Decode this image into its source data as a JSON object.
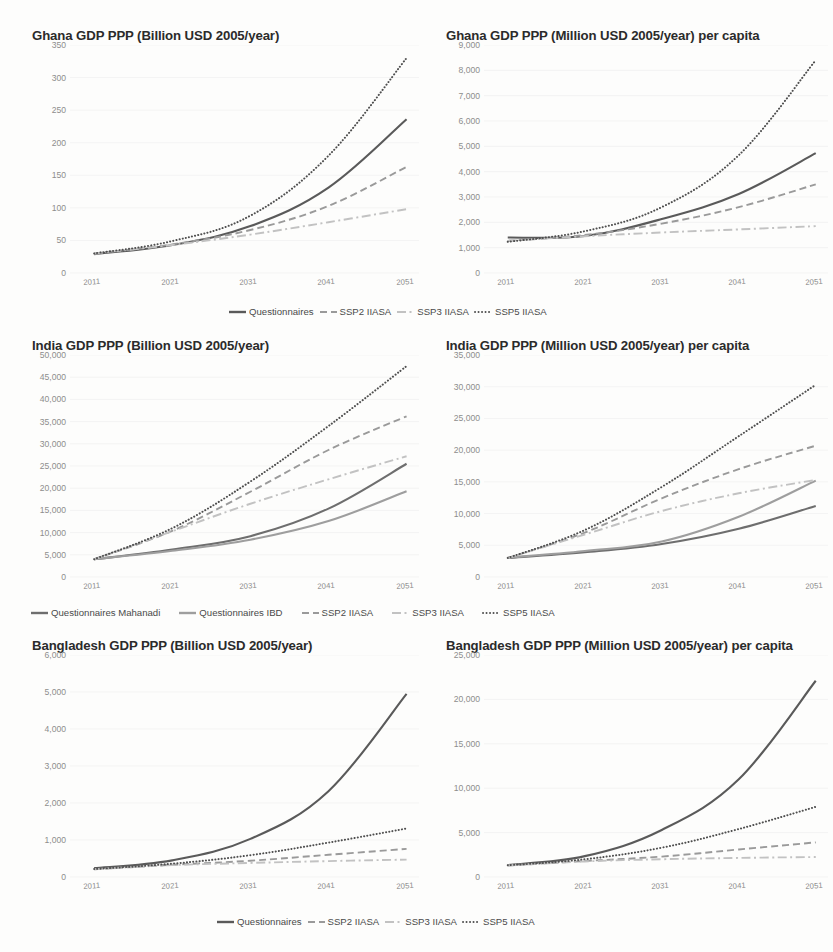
{
  "page": {
    "background": "#fdfdfc",
    "colors": {
      "solid_dark": "#5a5a5a",
      "solid_mid": "#8a8a8a",
      "dashed": "#9a9a9a",
      "dashdot": "#c2c2c2",
      "dotted": "#4f4f4f",
      "axis_text": "#8d8d8d",
      "title_text": "#2b2b2b",
      "gridline": "#efefef"
    }
  },
  "charts": [
    {
      "id": "ghana-total",
      "chart_data": {
        "type": "line",
        "title": "Ghana GDP PPP (Billion USD 2005/year)",
        "xlabel": "",
        "ylabel": "",
        "x": [
          2011,
          2021,
          2031,
          2041,
          2051
        ],
        "xticks": [
          "2011",
          "2021",
          "2031",
          "2041",
          "2051"
        ],
        "yticks": [
          "0",
          "50",
          "100",
          "150",
          "200",
          "250",
          "300",
          "350"
        ],
        "ylim": [
          0,
          350
        ],
        "ytick_step": 50,
        "grid": true,
        "legend_position": "bottom",
        "series": [
          {
            "name": "Questionnaires",
            "style": "solid",
            "color": "#5a5a5a",
            "values": [
              29,
              43,
              72,
              131,
              236
            ]
          },
          {
            "name": "SSP2 IIASA",
            "style": "dashed",
            "color": "#9a9a9a",
            "values": [
              30,
              44,
              66,
              103,
              163
            ]
          },
          {
            "name": "SSP3 IIASA",
            "style": "dashdot",
            "color": "#c2c2c2",
            "values": [
              30,
              43,
              59,
              78,
              98
            ]
          },
          {
            "name": "SSP5 IIASA",
            "style": "dotted",
            "color": "#4f4f4f",
            "values": [
              30,
              49,
              88,
              180,
              330
            ]
          }
        ]
      }
    },
    {
      "id": "ghana-percapita",
      "chart_data": {
        "type": "line",
        "title": "Ghana GDP PPP (Million USD 2005/year) per capita",
        "xlabel": "",
        "ylabel": "",
        "x": [
          2011,
          2021,
          2031,
          2041,
          2051
        ],
        "xticks": [
          "2011",
          "2021",
          "2031",
          "2041",
          "2051"
        ],
        "yticks": [
          "0",
          "1,000",
          "2,000",
          "3,000",
          "4,000",
          "5,000",
          "6,000",
          "7,000",
          "8,000",
          "9,000"
        ],
        "ylim": [
          0,
          9000
        ],
        "ytick_step": 1000,
        "grid": true,
        "legend_position": "bottom",
        "series": [
          {
            "name": "Questionnaires",
            "style": "solid",
            "color": "#5a5a5a",
            "values": [
              1400,
              1460,
              2130,
              3120,
              4730
            ]
          },
          {
            "name": "SSP2 IIASA",
            "style": "dashed",
            "color": "#9a9a9a",
            "values": [
              1270,
              1500,
              1950,
              2600,
              3500
            ]
          },
          {
            "name": "SSP3 IIASA",
            "style": "dashdot",
            "color": "#c2c2c2",
            "values": [
              1270,
              1450,
              1600,
              1720,
              1850
            ]
          },
          {
            "name": "SSP5 IIASA",
            "style": "dotted",
            "color": "#4f4f4f",
            "values": [
              1230,
              1650,
              2600,
              4650,
              8400
            ]
          }
        ]
      }
    },
    {
      "id": "india-total",
      "chart_data": {
        "type": "line",
        "title": "India GDP PPP (Billion USD 2005/year)",
        "xlabel": "",
        "ylabel": "",
        "x": [
          2011,
          2021,
          2031,
          2041,
          2051
        ],
        "xticks": [
          "2011",
          "2021",
          "2031",
          "2041",
          "2051"
        ],
        "yticks": [
          "0",
          "5,000",
          "10,000",
          "15,000",
          "20,000",
          "25,000",
          "30,000",
          "35,000",
          "40,000",
          "45,000",
          "50,000"
        ],
        "ylim": [
          0,
          50000
        ],
        "ytick_step": 5000,
        "grid": true,
        "legend_position": "bottom",
        "series": [
          {
            "name": "Questionnaires Mahanadi",
            "style": "solid",
            "color": "#6e6e6e",
            "values": [
              4000,
              6200,
              9200,
              15400,
              25500
            ]
          },
          {
            "name": "Questionnaires IBD",
            "style": "solid",
            "color": "#9e9e9e",
            "values": [
              4000,
              5900,
              8400,
              12600,
              19300
            ]
          },
          {
            "name": "SSP2 IIASA",
            "style": "dashed",
            "color": "#9a9a9a",
            "values": [
              4000,
              10400,
              19200,
              28600,
              36200
            ]
          },
          {
            "name": "SSP3 IIASA",
            "style": "dashdot",
            "color": "#c2c2c2",
            "values": [
              4000,
              10300,
              16500,
              22000,
              27200
            ]
          },
          {
            "name": "SSP5 IIASA",
            "style": "dotted",
            "color": "#4f4f4f",
            "values": [
              4000,
              11000,
              21500,
              34000,
              47500
            ]
          }
        ]
      }
    },
    {
      "id": "india-percapita",
      "chart_data": {
        "type": "line",
        "title": "India GDP PPP (Million USD 2005/year) per capita",
        "xlabel": "",
        "ylabel": "",
        "x": [
          2011,
          2021,
          2031,
          2041,
          2051
        ],
        "xticks": [
          "2011",
          "2021",
          "2031",
          "2041",
          "2051"
        ],
        "yticks": [
          "0",
          "5,000",
          "10,000",
          "15,000",
          "20,000",
          "25,000",
          "30,000",
          "35,000"
        ],
        "ylim": [
          0,
          35000
        ],
        "ytick_step": 5000,
        "grid": true,
        "legend_position": "bottom",
        "series": [
          {
            "name": "Questionnaires Mahanadi",
            "style": "solid",
            "color": "#6e6e6e",
            "values": [
              3000,
              3900,
              5200,
              7600,
              11200
            ]
          },
          {
            "name": "Questionnaires IBD",
            "style": "solid",
            "color": "#9e9e9e",
            "values": [
              3050,
              4100,
              5600,
              9500,
              15200
            ]
          },
          {
            "name": "SSP2 IIASA",
            "style": "dashed",
            "color": "#9a9a9a",
            "values": [
              3000,
              7000,
              12400,
              17000,
              20700
            ]
          },
          {
            "name": "SSP3 IIASA",
            "style": "dashdot",
            "color": "#c2c2c2",
            "values": [
              3000,
              6700,
              10400,
              13200,
              15300
            ]
          },
          {
            "name": "SSP5 IIASA",
            "style": "dotted",
            "color": "#4f4f4f",
            "values": [
              3000,
              7400,
              14200,
              22200,
              30300
            ]
          }
        ]
      }
    },
    {
      "id": "bangladesh-total",
      "chart_data": {
        "type": "line",
        "title": "Bangladesh GDP PPP (Billion USD 2005/year)",
        "xlabel": "",
        "ylabel": "",
        "x": [
          2011,
          2021,
          2031,
          2041,
          2051
        ],
        "xticks": [
          "2011",
          "2021",
          "2031",
          "2041",
          "2051"
        ],
        "yticks": [
          "0",
          "1,000",
          "2,000",
          "3,000",
          "4,000",
          "5,000",
          "6,000"
        ],
        "ylim": [
          0,
          6000
        ],
        "ytick_step": 1000,
        "grid": true,
        "legend_position": "bottom",
        "series": [
          {
            "name": "Questionnaires",
            "style": "solid",
            "color": "#5a5a5a",
            "values": [
              240,
              450,
              1030,
              2320,
              4950
            ]
          },
          {
            "name": "SSP2 IIASA",
            "style": "dashed",
            "color": "#9a9a9a",
            "values": [
              210,
              330,
              440,
              600,
              760
            ]
          },
          {
            "name": "SSP3 IIASA",
            "style": "dashdot",
            "color": "#c2c2c2",
            "values": [
              210,
              320,
              380,
              430,
              470
            ]
          },
          {
            "name": "SSP5 IIASA",
            "style": "dotted",
            "color": "#4f4f4f",
            "values": [
              215,
              360,
              590,
              930,
              1310
            ]
          }
        ]
      }
    },
    {
      "id": "bangladesh-percapita",
      "chart_data": {
        "type": "line",
        "title": "Bangladesh GDP PPP (Million USD 2005/year) per capita",
        "xlabel": "",
        "ylabel": "",
        "x": [
          2011,
          2021,
          2031,
          2041,
          2051
        ],
        "xticks": [
          "2011",
          "2021",
          "2031",
          "2041",
          "2051"
        ],
        "yticks": [
          "0",
          "5,000",
          "10,000",
          "15,000",
          "20,000",
          "25,000"
        ],
        "ylim": [
          0,
          25000
        ],
        "ytick_step": 5000,
        "grid": true,
        "legend_position": "bottom",
        "series": [
          {
            "name": "Questionnaires",
            "style": "solid",
            "color": "#5a5a5a",
            "values": [
              1350,
              2350,
              5300,
              11000,
              22100
            ]
          },
          {
            "name": "SSP2 IIASA",
            "style": "dashed",
            "color": "#9a9a9a",
            "values": [
              1300,
              1800,
              2300,
              3100,
              3900
            ]
          },
          {
            "name": "SSP3 IIASA",
            "style": "dashdot",
            "color": "#c2c2c2",
            "values": [
              1300,
              1750,
              2000,
              2150,
              2250
            ]
          },
          {
            "name": "SSP5 IIASA",
            "style": "dotted",
            "color": "#4f4f4f",
            "values": [
              1320,
              2000,
              3300,
              5400,
              7900
            ]
          }
        ]
      }
    }
  ],
  "legends": [
    {
      "id": "legend-row-1",
      "items": [
        {
          "label": "Questionnaires",
          "style": "solid",
          "color": "#5a5a5a"
        },
        {
          "label": "SSP2 IIASA",
          "style": "dashed",
          "color": "#9a9a9a"
        },
        {
          "label": "SSP3 IIASA",
          "style": "dashdot",
          "color": "#c2c2c2"
        },
        {
          "label": "SSP5 IIASA",
          "style": "dotted",
          "color": "#4f4f4f"
        }
      ]
    },
    {
      "id": "legend-row-2",
      "items": [
        {
          "label": "Questionnaires Mahanadi",
          "style": "solid",
          "color": "#6e6e6e"
        },
        {
          "label": "Questionnaires IBD",
          "style": "solid",
          "color": "#9e9e9e"
        },
        {
          "label": "SSP2 IIASA",
          "style": "dashed",
          "color": "#9a9a9a"
        },
        {
          "label": "SSP3 IIASA",
          "style": "dashdot",
          "color": "#c2c2c2"
        },
        {
          "label": "SSP5 IIASA",
          "style": "dotted",
          "color": "#4f4f4f"
        }
      ]
    },
    {
      "id": "legend-row-3",
      "items": [
        {
          "label": "Questionnaires",
          "style": "solid",
          "color": "#5a5a5a"
        },
        {
          "label": "SSP2 IIASA",
          "style": "dashed",
          "color": "#9a9a9a"
        },
        {
          "label": "SSP3 IIASA",
          "style": "dashdot",
          "color": "#c2c2c2"
        },
        {
          "label": "SSP5 IIASA",
          "style": "dotted",
          "color": "#4f4f4f"
        }
      ]
    }
  ],
  "layout": {
    "blocks": [
      {
        "chart": 0,
        "left": 18,
        "top": 28,
        "titleLeft": 14,
        "plotLeft": 46,
        "plotTop": 22,
        "plotW": 355,
        "plotH": 228
      },
      {
        "chart": 1,
        "left": 432,
        "top": 28,
        "titleLeft": 14,
        "plotLeft": 46,
        "plotTop": 22,
        "plotW": 350,
        "plotH": 228
      },
      {
        "chart": 2,
        "left": 18,
        "top": 338,
        "titleLeft": 14,
        "plotLeft": 46,
        "plotTop": 22,
        "plotW": 355,
        "plotH": 222
      },
      {
        "chart": 3,
        "left": 432,
        "top": 338,
        "titleLeft": 14,
        "plotLeft": 46,
        "plotTop": 22,
        "plotW": 350,
        "plotH": 222
      },
      {
        "chart": 4,
        "left": 18,
        "top": 638,
        "titleLeft": 14,
        "plotLeft": 46,
        "plotTop": 22,
        "plotW": 355,
        "plotH": 222
      },
      {
        "chart": 5,
        "left": 432,
        "top": 638,
        "titleLeft": 14,
        "plotLeft": 46,
        "plotTop": 22,
        "plotW": 350,
        "plotH": 222
      }
    ],
    "legendPos": [
      {
        "legend": 0,
        "left": 228,
        "top": 306
      },
      {
        "legend": 1,
        "left": 30,
        "top": 607
      },
      {
        "legend": 2,
        "left": 216,
        "top": 916
      }
    ]
  }
}
